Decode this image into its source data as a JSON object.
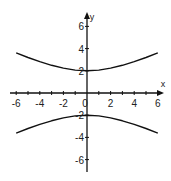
{
  "chart_data": {
    "type": "line",
    "title": "",
    "xlabel": "x",
    "ylabel": "y",
    "xlim": [
      -6.5,
      6.5
    ],
    "ylim": [
      -7,
      7
    ],
    "grid": false,
    "x_ticks": [
      -6,
      -4,
      -2,
      0,
      2,
      4,
      6
    ],
    "x_tick_labels": [
      "-6",
      "-4",
      "-2",
      "0",
      "2",
      "4",
      "6"
    ],
    "y_ticks": [
      6,
      4,
      2,
      -2,
      -4,
      -6
    ],
    "y_tick_labels": [
      "6",
      "4",
      "2",
      "-2",
      "-4",
      "-6"
    ],
    "equation": "y^2/4 - x^2/16 = 1",
    "series": [
      {
        "name": "upper branch",
        "x": [
          -6,
          -5,
          -4,
          -3,
          -2,
          -1,
          0,
          1,
          2,
          3,
          4,
          5,
          6
        ],
        "y": [
          3.61,
          3.2,
          2.83,
          2.5,
          2.24,
          2.06,
          2.0,
          2.06,
          2.24,
          2.5,
          2.83,
          3.2,
          3.61
        ]
      },
      {
        "name": "lower branch",
        "x": [
          -6,
          -5,
          -4,
          -3,
          -2,
          -1,
          0,
          1,
          2,
          3,
          4,
          5,
          6
        ],
        "y": [
          -3.61,
          -3.2,
          -2.83,
          -2.5,
          -2.24,
          -2.06,
          -2.0,
          -2.06,
          -2.24,
          -2.5,
          -2.83,
          -3.2,
          -3.61
        ]
      }
    ]
  }
}
